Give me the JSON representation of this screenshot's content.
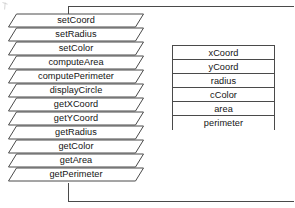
{
  "diagram": {
    "line_color": "#4a4a4a",
    "text_color": "#141414",
    "background": "#ffffff"
  },
  "methods_stack": {
    "name": "operations",
    "shape": "parallelogram",
    "items": [
      {
        "label": "setCoord"
      },
      {
        "label": "setRadius"
      },
      {
        "label": "setColor"
      },
      {
        "label": "computeArea"
      },
      {
        "label": "computePerimeter"
      },
      {
        "label": "displayCircle"
      },
      {
        "label": "getXCoord"
      },
      {
        "label": "getYCoord"
      },
      {
        "label": "getRadius"
      },
      {
        "label": "getColor"
      },
      {
        "label": "getArea"
      },
      {
        "label": "getPerimeter"
      }
    ]
  },
  "attributes_table": {
    "name": "attributes",
    "shape": "rectangle",
    "items": [
      {
        "label": "xCoord"
      },
      {
        "label": "yCoord"
      },
      {
        "label": "radius"
      },
      {
        "label": "cColor"
      },
      {
        "label": "area"
      },
      {
        "label": "perimeter"
      }
    ]
  },
  "connectors": [
    {
      "name": "top-connector",
      "path": "M 68.5 182.5 L 68.5 182.5"
    },
    {
      "name": "bottom-connector",
      "path": "M 68.5 183.5 L 68.5 183.5"
    }
  ]
}
